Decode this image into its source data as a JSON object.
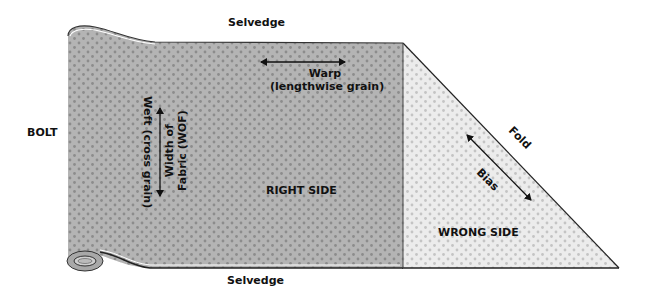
{
  "labels": {
    "selvedge_top": "Selvedge",
    "selvedge_bottom": "Selvedge",
    "bolt": "BOLT",
    "warp_line1": "Warp",
    "warp_line2": "(lengthwise grain)",
    "weft": "Weft (cross grain)",
    "wof_line1": "Width of",
    "wof_line2": "Fabric (WOF)",
    "right_side": "RIGHT SIDE",
    "wrong_side": "WRONG SIDE",
    "fold": "Fold",
    "bias": "Bias"
  },
  "colors": {
    "right_side_fill": "#b4b4b4",
    "right_side_dots": "#8c8c8c",
    "wrong_side_fill": "#ececec",
    "wrong_side_dots": "#c4c4c4",
    "outline": "#222222",
    "text": "#111111"
  }
}
